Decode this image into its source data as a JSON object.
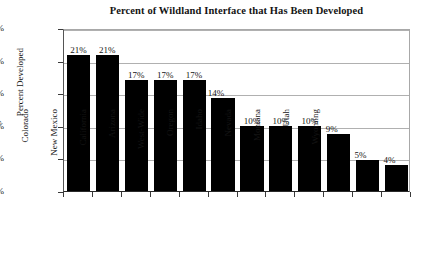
{
  "chart_data": {
    "type": "bar",
    "title": "Percent of Wildland Interface that Has Been Developed",
    "xlabel": "",
    "ylabel": "Percent Developed",
    "ylim": [
      0,
      25
    ],
    "ytick_labels": [
      "0%",
      "5%",
      "10%",
      "15%",
      "20%",
      "25%"
    ],
    "ytick_values": [
      0,
      5,
      10,
      15,
      20,
      25
    ],
    "grid": true,
    "legend": false,
    "bar_color": "#000000",
    "gridline_color": "#b0b0b0",
    "categories": [
      "Washington",
      "Colorado",
      "New Mexico",
      "California",
      "Arizona",
      "West-Wide",
      "Oregon",
      "Idaho",
      "Nevada",
      "Montana",
      "Utah",
      "Wyoming"
    ],
    "values": [
      20.8,
      20.8,
      17.0,
      17.0,
      17.0,
      14.2,
      10.0,
      10.0,
      10.0,
      8.7,
      4.8,
      4.0
    ],
    "data_labels": [
      "21%",
      "21%",
      "17%",
      "17%",
      "17%",
      "14%",
      "10%",
      "10%",
      "10%",
      "9%",
      "5%",
      "4%"
    ]
  }
}
